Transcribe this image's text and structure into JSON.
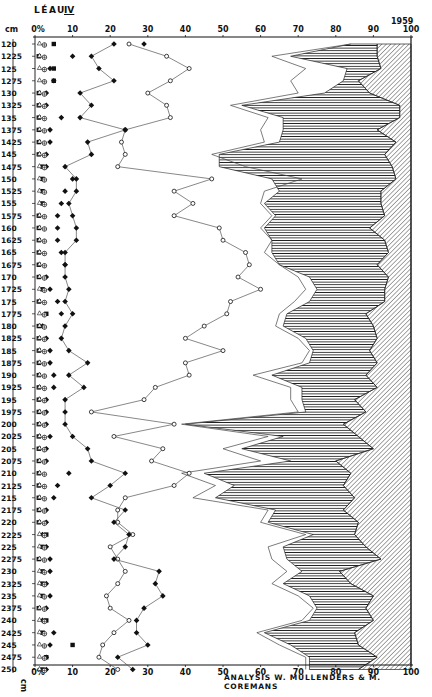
{
  "header": {
    "site": "LÉAU",
    "zone": "IV",
    "year": "1959",
    "depth_unit": "cm",
    "bottom_unit": "cm"
  },
  "footer": {
    "credit": "ANALYSIS  W. MULLENDERS  & M. COREMANS"
  },
  "colors": {
    "ink": "#111111",
    "paper": "#ffffff",
    "line": "#555555"
  },
  "chart_data": {
    "type": "line",
    "xlabel": "%",
    "ylabel": "cm",
    "xlim": [
      0,
      100
    ],
    "x_ticks_top": [
      "0%",
      "10",
      "20",
      "30",
      "40",
      "50",
      "60",
      "70",
      "80",
      "90",
      "100"
    ],
    "x_ticks_bottom": [
      "0%",
      "10",
      "20",
      "30",
      "40",
      "50",
      "60",
      "70",
      "80",
      "90",
      "100"
    ],
    "depths": [
      "120",
      "1225",
      "125",
      "1275",
      "130",
      "1325",
      "135",
      "1375",
      "1425",
      "145",
      "1475",
      "150",
      "1525",
      "155",
      "1575",
      "160",
      "1625",
      "165",
      "1675",
      "170",
      "1725",
      "175",
      "1775",
      "180",
      "1825",
      "185",
      "1875",
      "190",
      "1925",
      "195",
      "1975",
      "200",
      "2025",
      "205",
      "2075",
      "210",
      "2125",
      "215",
      "2175",
      "220",
      "2225",
      "225",
      "2275",
      "230",
      "2325",
      "235",
      "2375",
      "240",
      "2425",
      "245",
      "2475",
      "250"
    ],
    "grid": false,
    "annotations": [
      "ANALYSIS W. MULLENDERS & M. COREMANS"
    ],
    "series": [
      {
        "name": "filled-square",
        "marker": "square-filled",
        "values": [
          5,
          1,
          5,
          5,
          1,
          1,
          1,
          1,
          1,
          1,
          2,
          2,
          2,
          2,
          1,
          1,
          1,
          1,
          1,
          1,
          2,
          1,
          3,
          1,
          1,
          1,
          1,
          1,
          1,
          1,
          1,
          1,
          1,
          1,
          1,
          1,
          1,
          1,
          1,
          1,
          3,
          2,
          1,
          2,
          2,
          2,
          1,
          3,
          2,
          10,
          3,
          2
        ]
      },
      {
        "name": "filled-diamond-inner",
        "marker": "diamond-filled",
        "values": [
          29,
          10,
          4,
          5,
          3,
          3,
          7,
          4,
          4,
          3,
          3,
          10,
          8,
          7,
          6,
          6,
          6,
          7,
          8,
          3,
          4,
          6,
          7,
          2,
          3,
          4,
          4,
          5,
          5,
          3,
          3,
          3,
          4,
          3,
          3,
          9,
          6,
          5,
          3,
          3,
          2,
          3,
          4,
          4,
          3,
          4,
          3,
          2,
          5,
          4,
          3,
          3
        ]
      },
      {
        "name": "filled-diamond",
        "marker": "diamond-filled",
        "values": [
          21,
          15,
          17,
          21,
          12,
          15,
          12,
          24,
          14,
          15,
          8,
          11,
          11,
          9,
          10,
          11,
          11,
          8,
          8,
          8,
          9,
          8,
          10,
          8,
          7,
          9,
          14,
          9,
          13,
          8,
          8,
          8,
          10,
          14,
          15,
          24,
          20,
          15,
          24,
          21,
          25,
          24,
          21,
          33,
          32,
          34,
          29,
          27,
          27,
          30,
          22,
          26
        ]
      },
      {
        "name": "open-circle",
        "marker": "circle-open",
        "values": [
          25,
          35,
          41,
          36,
          30,
          35,
          36,
          24,
          23,
          24,
          22,
          47,
          37,
          42,
          37,
          49,
          50,
          56,
          57,
          54,
          60,
          52,
          51,
          45,
          40,
          50,
          40,
          41,
          32,
          29,
          15,
          37,
          21,
          34,
          31,
          41,
          37,
          24,
          22,
          22,
          26,
          20,
          22,
          24,
          22,
          19,
          20,
          25,
          21,
          18,
          17,
          22
        ]
      },
      {
        "name": "outer-boundary",
        "marker": "none",
        "values": [
          84,
          63,
          72,
          68,
          70,
          52,
          62,
          60,
          61,
          47,
          56,
          71,
          61,
          60,
          63,
          60,
          63,
          61,
          65,
          70,
          72,
          69,
          65,
          64,
          70,
          73,
          71,
          58,
          68,
          68,
          70,
          39,
          62,
          50,
          60,
          39,
          48,
          42,
          62,
          60,
          72,
          62,
          63,
          67,
          63,
          70,
          74,
          71,
          59,
          65,
          72,
          72
        ]
      },
      {
        "name": "hatched-horizontal-left",
        "marker": "none",
        "values": [
          84,
          68,
          83,
          82,
          77,
          55,
          66,
          66,
          65,
          49,
          49,
          63,
          65,
          61,
          64,
          61,
          63,
          63,
          65,
          73,
          75,
          73,
          67,
          66,
          72,
          74,
          73,
          63,
          71,
          71,
          72,
          40,
          66,
          55,
          68,
          45,
          53,
          48,
          64,
          62,
          74,
          66,
          67,
          71,
          66,
          73,
          75,
          73,
          61,
          68,
          73,
          73
        ]
      },
      {
        "name": "hatched-diagonal-left",
        "marker": "none",
        "values": [
          91,
          91,
          92,
          86,
          89,
          97,
          97,
          91,
          96,
          93,
          95,
          96,
          92,
          92,
          93,
          89,
          93,
          94,
          91,
          94,
          93,
          93,
          88,
          90,
          91,
          89,
          91,
          88,
          91,
          85,
          88,
          82,
          86,
          90,
          80,
          84,
          82,
          85,
          82,
          86,
          85,
          88,
          92,
          81,
          84,
          90,
          88,
          90,
          85,
          86,
          91,
          86
        ]
      }
    ]
  }
}
